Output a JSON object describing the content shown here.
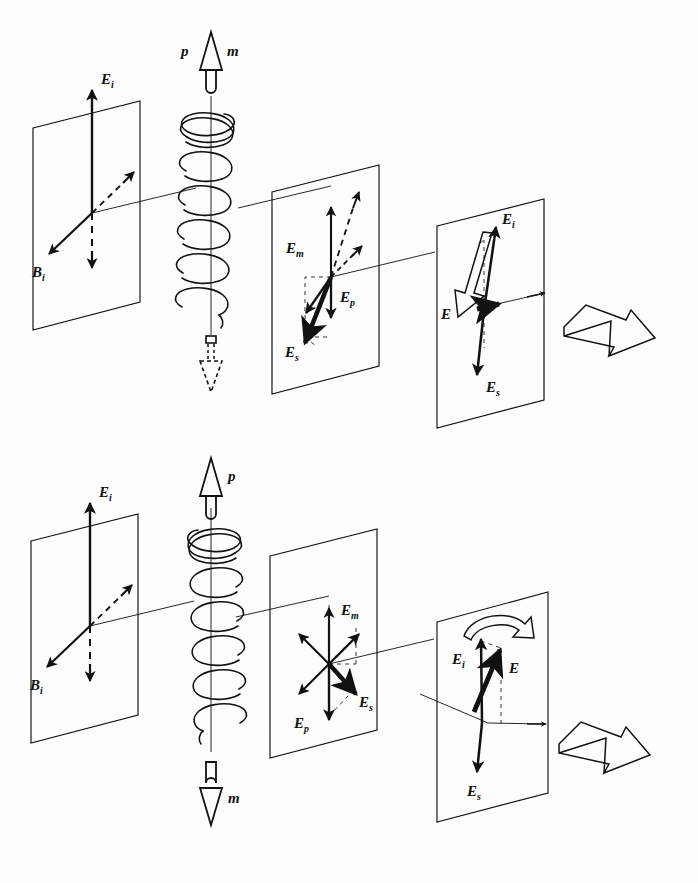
{
  "figure": {
    "background_color": "#fdfdfd",
    "ink_color": "#111111",
    "width": 698,
    "height": 883
  },
  "panels": [
    {
      "id": "top",
      "name": "right-handed-helix-panel",
      "helix": {
        "handedness": "right-handed",
        "turns": 6
      },
      "axis_arrows": {
        "top": {
          "labels": [
            "p",
            "m"
          ],
          "direction": "up",
          "style": "solid-outline"
        },
        "bottom": {
          "labels": [],
          "direction": "down",
          "style": "dashed-hidden"
        }
      },
      "planes": [
        {
          "id": "top-plane-1",
          "name": "incident-plane",
          "vectors": [
            {
              "label": "E",
              "sub": "i",
              "style": "solid",
              "dir": "up"
            },
            {
              "label": "B",
              "sub": "i",
              "style": "solid",
              "dir": "down-left"
            },
            {
              "label": "",
              "sub": "",
              "style": "dashed",
              "dir": "up-right"
            },
            {
              "label": "",
              "sub": "",
              "style": "dashed",
              "dir": "down"
            }
          ]
        },
        {
          "id": "top-plane-2",
          "name": "induced-moments-plane",
          "vectors": [
            {
              "label": "E",
              "sub": "m",
              "style": "solid",
              "dir": "down-left"
            },
            {
              "label": "E",
              "sub": "p",
              "style": "solid",
              "dir": "down"
            },
            {
              "label": "E",
              "sub": "s",
              "style": "solid-bold",
              "dir": "down-left-long"
            },
            {
              "label": "",
              "sub": "",
              "style": "solid",
              "dir": "up"
            },
            {
              "label": "",
              "sub": "",
              "style": "dashed",
              "dir": "up-right-long"
            },
            {
              "label": "",
              "sub": "",
              "style": "dashed",
              "dir": "up-right-short"
            }
          ]
        },
        {
          "id": "top-plane-3",
          "name": "resultant-plane",
          "rotation_arrow": {
            "style": "hollow-3d",
            "direction": "down-left"
          },
          "vectors": [
            {
              "label": "E",
              "sub": "i",
              "style": "solid",
              "dir": "up"
            },
            {
              "label": "E",
              "sub": "",
              "style": "solid-bold",
              "dir": "right"
            },
            {
              "label": "E",
              "sub": "s",
              "style": "solid",
              "dir": "down"
            }
          ]
        }
      ],
      "exit_arrow": {
        "style": "hollow-3d",
        "direction": "right"
      }
    },
    {
      "id": "bottom",
      "name": "left-handed-helix-panel",
      "helix": {
        "handedness": "left-handed",
        "turns": 6
      },
      "axis_arrows": {
        "top": {
          "labels": [
            "p"
          ],
          "direction": "up",
          "style": "solid-outline"
        },
        "bottom": {
          "labels": [
            "m"
          ],
          "direction": "down",
          "style": "solid-outline"
        }
      },
      "planes": [
        {
          "id": "bottom-plane-1",
          "name": "incident-plane",
          "vectors": [
            {
              "label": "E",
              "sub": "i",
              "style": "solid",
              "dir": "up"
            },
            {
              "label": "B",
              "sub": "i",
              "style": "solid",
              "dir": "down-left"
            },
            {
              "label": "",
              "sub": "",
              "style": "dashed",
              "dir": "up-right"
            },
            {
              "label": "",
              "sub": "",
              "style": "dashed",
              "dir": "down"
            }
          ]
        },
        {
          "id": "bottom-plane-2",
          "name": "induced-moments-plane",
          "vectors": [
            {
              "label": "E",
              "sub": "m",
              "style": "solid",
              "dir": "up-right"
            },
            {
              "label": "E",
              "sub": "p",
              "style": "solid",
              "dir": "down"
            },
            {
              "label": "E",
              "sub": "s",
              "style": "solid-bold",
              "dir": "down-right"
            },
            {
              "label": "",
              "sub": "",
              "style": "solid",
              "dir": "up"
            },
            {
              "label": "",
              "sub": "",
              "style": "solid",
              "dir": "up-left"
            },
            {
              "label": "",
              "sub": "",
              "style": "solid",
              "dir": "down-left"
            }
          ]
        },
        {
          "id": "bottom-plane-3",
          "name": "resultant-plane",
          "rotation_arrow": {
            "style": "hollow-curved",
            "direction": "clockwise"
          },
          "vectors": [
            {
              "label": "E",
              "sub": "i",
              "style": "solid",
              "dir": "up"
            },
            {
              "label": "E",
              "sub": "",
              "style": "solid-bold",
              "dir": "up-right"
            },
            {
              "label": "E",
              "sub": "s",
              "style": "solid",
              "dir": "down"
            }
          ]
        }
      ],
      "exit_arrow": {
        "style": "hollow-3d",
        "direction": "right"
      }
    }
  ],
  "labels": {
    "E_i": "E",
    "E_i_sub": "i",
    "B_i": "B",
    "B_i_sub": "i",
    "E_m": "E",
    "E_m_sub": "m",
    "E_p": "E",
    "E_p_sub": "p",
    "E_s": "E",
    "E_s_sub": "s",
    "E": "E",
    "p": "p",
    "m": "m"
  }
}
